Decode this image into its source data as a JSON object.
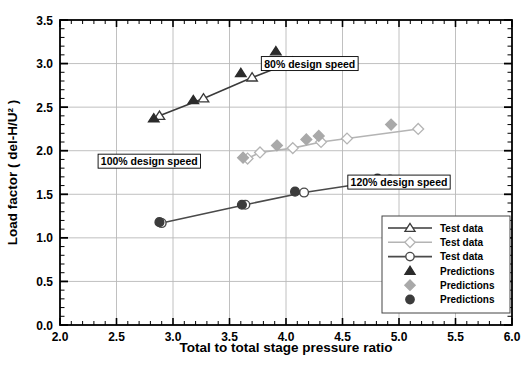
{
  "chart_data": {
    "type": "scatter",
    "title": "",
    "xlabel": "Total to total  stage pressure ratio",
    "ylabel": "Load factor ( del-H/U² )",
    "xlim": [
      2.0,
      6.0
    ],
    "ylim": [
      0.0,
      3.5
    ],
    "xticks": [
      "2.0",
      "2.5",
      "3.0",
      "3.5",
      "4.0",
      "4.5",
      "5.0",
      "5.5",
      "6.0"
    ],
    "xtick_values": [
      2.0,
      2.5,
      3.0,
      3.5,
      4.0,
      4.5,
      5.0,
      5.5,
      6.0
    ],
    "yticks": [
      "0.0",
      "0.5",
      "1.0",
      "1.5",
      "2.0",
      "2.5",
      "3.0",
      "3.5"
    ],
    "ytick_values": [
      0.0,
      0.5,
      1.0,
      1.5,
      2.0,
      2.5,
      3.0,
      3.5
    ],
    "grid": true,
    "minor_ticks": true,
    "legend_position": "lower right",
    "series": [
      {
        "name": "Test data",
        "key": "test_80",
        "marker": "open-triangle",
        "color": "#3a3a3a",
        "line": true,
        "x": [
          2.88,
          3.27,
          3.7,
          4.06
        ],
        "y": [
          2.4,
          2.6,
          2.84,
          3.02
        ]
      },
      {
        "name": "Test data",
        "key": "test_100",
        "marker": "open-diamond",
        "color": "#b4b4b4",
        "line": true,
        "x": [
          3.66,
          3.77,
          4.06,
          4.31,
          4.54,
          5.17
        ],
        "y": [
          1.91,
          1.98,
          2.03,
          2.1,
          2.14,
          2.25
        ]
      },
      {
        "name": "Test data",
        "key": "test_120",
        "marker": "open-circle",
        "color": "#4a4a4a",
        "line": true,
        "x": [
          2.9,
          3.64,
          4.16,
          4.92
        ],
        "y": [
          1.17,
          1.38,
          1.52,
          1.67
        ]
      },
      {
        "name": "Predictions",
        "key": "pred_80",
        "marker": "filled-triangle",
        "color": "#2b2b2b",
        "line": false,
        "x": [
          2.83,
          3.18,
          3.6,
          3.91
        ],
        "y": [
          2.37,
          2.58,
          2.89,
          3.14
        ]
      },
      {
        "name": "Predictions",
        "key": "pred_100",
        "marker": "filled-diamond",
        "color": "#a9a9a9",
        "line": false,
        "x": [
          3.62,
          3.92,
          4.18,
          4.29,
          4.93
        ],
        "y": [
          1.92,
          2.06,
          2.13,
          2.17,
          2.3
        ]
      },
      {
        "name": "Predictions",
        "key": "pred_120",
        "marker": "filled-circle",
        "color": "#3c3c3c",
        "line": false,
        "x": [
          2.88,
          3.61,
          4.08,
          4.81
        ],
        "y": [
          1.18,
          1.38,
          1.53,
          1.68
        ]
      }
    ],
    "annotations": [
      {
        "key": "speed_80",
        "text": "80% design speed",
        "x": 4.21,
        "y": 3.0
      },
      {
        "key": "speed_100",
        "text": "100% design speed",
        "x": 2.79,
        "y": 1.88
      },
      {
        "key": "speed_120",
        "text": "120% design speed",
        "x": 5.0,
        "y": 1.64
      }
    ],
    "legend_entries": [
      {
        "label": "Test data",
        "marker": "open-triangle",
        "color": "#3a3a3a",
        "line": true
      },
      {
        "label": "Test data",
        "marker": "open-diamond",
        "color": "#b4b4b4",
        "line": true
      },
      {
        "label": "Test data",
        "marker": "open-circle",
        "color": "#4a4a4a",
        "line": true
      },
      {
        "label": "Predictions",
        "marker": "filled-triangle",
        "color": "#2b2b2b",
        "line": false
      },
      {
        "label": "Predictions",
        "marker": "filled-diamond",
        "color": "#a9a9a9",
        "line": false
      },
      {
        "label": "Predictions",
        "marker": "filled-circle",
        "color": "#3c3c3c",
        "line": false
      }
    ]
  }
}
